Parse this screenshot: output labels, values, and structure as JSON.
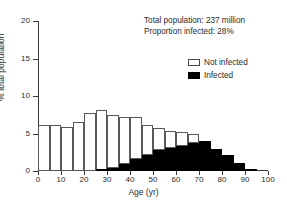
{
  "chart_data": {
    "type": "bar",
    "title": "",
    "subtitle": "",
    "xlabel": "Age (yr)",
    "ylabel": "% total population",
    "xlim": [
      0,
      100
    ],
    "ylim": [
      0,
      20
    ],
    "xticks": [
      0,
      10,
      20,
      30,
      40,
      50,
      60,
      70,
      80,
      90,
      100
    ],
    "yticks": [
      0,
      5,
      10,
      15,
      20
    ],
    "xtick_labels": [
      "0",
      "10",
      "20",
      "30",
      "40",
      "50",
      "60",
      "70",
      "80",
      "90",
      "100"
    ],
    "ytick_labels": [
      "0",
      "5",
      "10",
      "15",
      "20"
    ],
    "grid": false,
    "bin_width": 5,
    "stacked": true,
    "legend_position": "upper-right",
    "categories": [
      "0-5",
      "5-10",
      "10-15",
      "15-20",
      "20-25",
      "25-30",
      "30-35",
      "35-40",
      "40-45",
      "45-50",
      "50-55",
      "55-60",
      "60-65",
      "65-70",
      "70-75",
      "75-80",
      "80-85",
      "85-90",
      "90-95"
    ],
    "bin_starts": [
      0,
      5,
      10,
      15,
      20,
      25,
      30,
      35,
      40,
      45,
      50,
      55,
      60,
      65,
      70,
      75,
      80,
      85,
      90
    ],
    "series": [
      {
        "name": "Not infected",
        "color": "#ffffff",
        "edge_color": "#595959",
        "values": [
          6.1,
          6.1,
          5.9,
          6.6,
          7.8,
          7.9,
          7.05,
          6.3,
          5.6,
          4.0,
          2.9,
          2.2,
          1.8,
          1.3,
          0.0,
          0.0,
          0.0,
          0.0,
          0.0
        ]
      },
      {
        "name": "Infected",
        "color": "#000000",
        "edge_color": "#000000",
        "values": [
          0.0,
          0.0,
          0.0,
          0.0,
          0.0,
          0.2,
          0.45,
          0.9,
          1.6,
          2.2,
          2.8,
          3.1,
          3.4,
          3.7,
          4.0,
          2.9,
          2.2,
          1.1,
          0.2
        ]
      }
    ],
    "totals": [
      6.1,
      6.1,
      5.9,
      6.6,
      7.8,
      8.1,
      7.5,
      7.2,
      7.2,
      6.2,
      5.7,
      5.3,
      5.2,
      5.0,
      4.0,
      2.9,
      2.2,
      1.1,
      0.2
    ],
    "annotations": [
      "Total population: 237 million",
      "Proportion infected: 28%"
    ]
  },
  "annotation": {
    "line1": "Total population: 237 million",
    "line2": "Proportion infected: 28%"
  },
  "legend": {
    "not_infected_label": "Not infected",
    "infected_label": "Infected"
  },
  "axes": {
    "x_title": "Age (yr)",
    "y_title": "% total population"
  }
}
